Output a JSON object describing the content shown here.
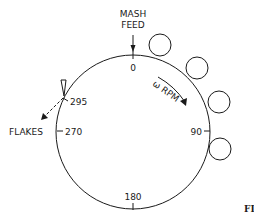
{
  "diagram": {
    "type": "rotating drum flaker schematic",
    "labels": {
      "mash_feed_line1": "MASH",
      "mash_feed_line2": "FEED",
      "flakes": "FLAKES",
      "rotation": "ω RPM",
      "fig": "FI"
    },
    "angle_ticks": [
      {
        "label": "0",
        "angle": 0
      },
      {
        "label": "90",
        "angle": 90
      },
      {
        "label": "180",
        "angle": 180
      },
      {
        "label": "270",
        "angle": 270
      },
      {
        "label": "295",
        "angle": 295
      }
    ],
    "rollers": [
      {
        "name": "roller-1",
        "cx": 160,
        "cy": 45,
        "r": 11
      },
      {
        "name": "roller-2",
        "cx": 197,
        "cy": 67,
        "r": 11
      },
      {
        "name": "roller-3",
        "cx": 219,
        "cy": 101,
        "r": 11
      },
      {
        "name": "roller-4",
        "cx": 220,
        "cy": 149,
        "r": 11
      }
    ],
    "colors": {
      "ink": "#1a1a1a",
      "background": "#ffffff"
    }
  }
}
